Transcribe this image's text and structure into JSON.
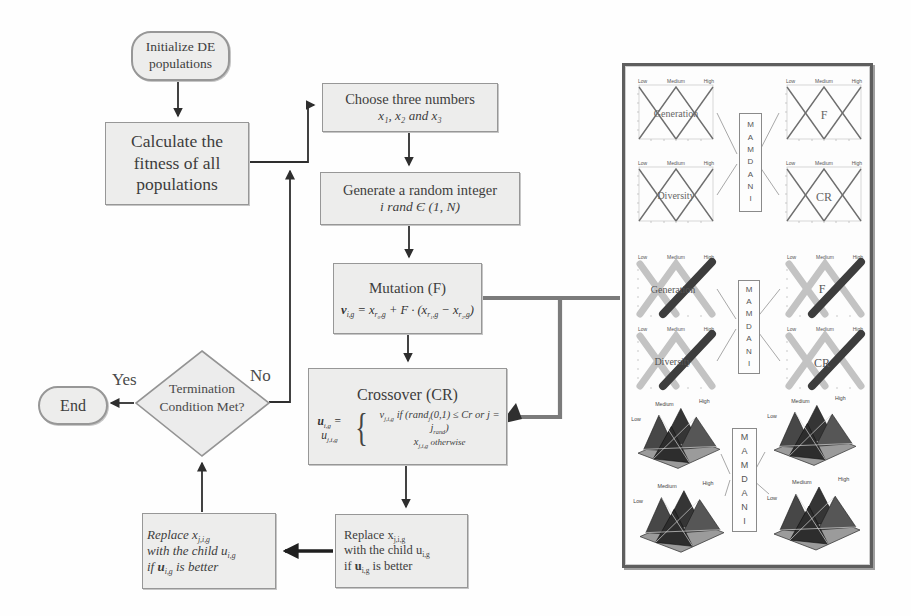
{
  "flowchart": {
    "init": [
      "Initialize DE",
      "populations"
    ],
    "fitness": [
      "Calculate the",
      "fitness of all",
      "populations"
    ],
    "choose": {
      "title": "Choose three numbers",
      "sub": "x₁,  x₂  and  x₃"
    },
    "generate": {
      "title": "Generate a random integer",
      "sub": "i rand Є (1, N)"
    },
    "mutation": {
      "title": "Mutation (F)",
      "f": [
        "v",
        "i,g",
        " = x",
        "r₀,g",
        " + F · (x",
        "r₁,g",
        " − x",
        "r₂,g",
        ")"
      ]
    },
    "crossover": {
      "title": "Crossover (CR)",
      "lhs": [
        "u",
        "i,g",
        " = u",
        "j,i,g"
      ],
      "brace": "{",
      "case1": [
        "v",
        "j,i,g",
        " if (rand",
        "j",
        "(0,1) ≤ Cr or j = j",
        "rand",
        ")"
      ],
      "case2": [
        "x",
        "j,i,g",
        "   otherwise"
      ]
    },
    "decision": [
      "Termination",
      "Condition Met?"
    ],
    "end_label": "End",
    "yes_label": "Yes",
    "no_label": "No",
    "replace": {
      "l1": [
        "Replace x",
        "j,i,g"
      ],
      "l2": [
        "with the child  ",
        "u",
        "i,g"
      ],
      "l3": [
        "if ",
        "u",
        "i,g",
        " is better"
      ]
    }
  },
  "panel": {
    "mamdani": "M A M D A N I",
    "mf_labels": {
      "low": "Low",
      "medium": "Medium",
      "high": "High"
    },
    "section1": {
      "tl": "Generation",
      "tr": "F",
      "bl": "Diversity",
      "br": "CR"
    },
    "section2": {
      "tl": "Generation",
      "tr": "F",
      "bl": "Diversity",
      "br": "CR"
    },
    "section3": {
      "low": "Low",
      "medium": "Medium",
      "high": "High"
    }
  },
  "colors": {
    "box_fill": "#ededec",
    "box_border": "#979797",
    "arrow": "#2e2e2e",
    "thick_connector": "#7b7b7b",
    "panel_border": "#5e5e5e",
    "mf_dark": "#3d3d3d",
    "mf_light": "#c3c3c3"
  }
}
